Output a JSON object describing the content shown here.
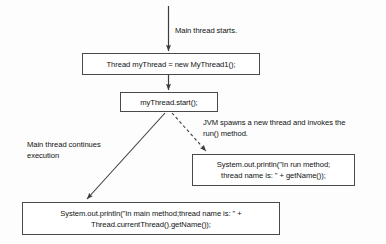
{
  "diagram": {
    "nodes": [
      {
        "id": "create",
        "name": "create-thread-statement",
        "text": "Thread myThread = new MyThread1();"
      },
      {
        "id": "start",
        "name": "start-thread-statement",
        "text": "myThread.start();"
      },
      {
        "id": "run_print",
        "name": "run-method-print-statement",
        "text": "System.out.println(\"In run method;\nthread name is: \" + getName());"
      },
      {
        "id": "main_print",
        "name": "main-method-print-statement",
        "text": "System.out.println(\"In main method;thread name is: \" +\nThread.currentThread().getName());"
      }
    ],
    "annotations": [
      {
        "id": "main_starts",
        "name": "main-thread-starts-label",
        "text": "Main thread starts."
      },
      {
        "id": "jvm_spawns",
        "name": "jvm-spawns-thread-label",
        "text": "JVM spawns a new thread and invokes the\nrun() method."
      },
      {
        "id": "main_continues",
        "name": "main-thread-continues-label",
        "text": "Main thread continues\nexecution"
      }
    ],
    "colors": {
      "stroke": "#3c3c3c",
      "box_border": "#4a4a4a",
      "box_fill": "#ffffff",
      "text": "#111111",
      "canvas": "#fdfdfd"
    }
  }
}
